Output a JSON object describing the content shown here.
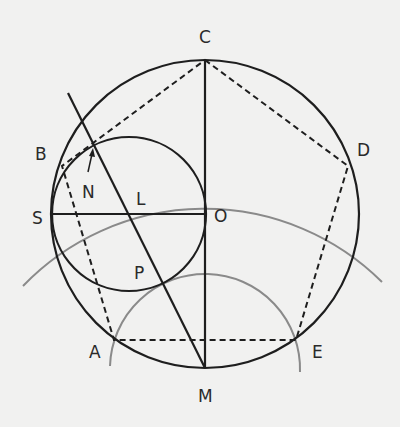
{
  "diagram": {
    "labels": {
      "C": "C",
      "B": "B",
      "D": "D",
      "N": "N",
      "L": "L",
      "S": "S",
      "O": "O",
      "P": "P",
      "A": "A",
      "E": "E",
      "M": "M"
    },
    "points": {
      "O": [
        205,
        214
      ],
      "C": [
        205,
        60
      ],
      "M": [
        205,
        368
      ],
      "S": [
        52,
        214
      ],
      "L": [
        129,
        214
      ],
      "B": [
        62,
        166
      ],
      "D": [
        348,
        166
      ],
      "A": [
        114,
        340
      ],
      "E": [
        296,
        340
      ],
      "N_tangent": [
        92,
        146
      ],
      "P": [
        162,
        285
      ]
    },
    "colors": {
      "ink": "#1e1e1e",
      "gray_arc": "#8a8a8a",
      "background": "#f1f1f0"
    }
  }
}
